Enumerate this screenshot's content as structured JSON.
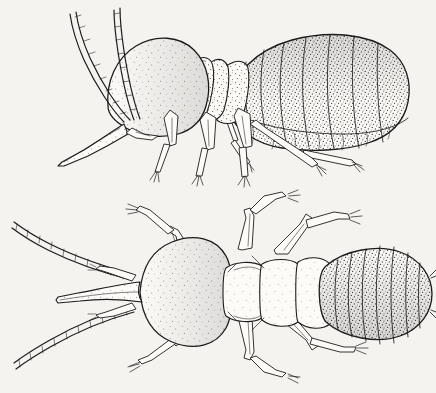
{
  "image": {
    "kind": "scientific-line-illustration",
    "technique": "pen-and-ink stipple drawing",
    "background_color": "#f4f3f0",
    "ink_color": "#1c1c1c",
    "subject_common_name": "nasute termite soldier",
    "views_count": 2,
    "visible_text": "",
    "caption": ""
  },
  "figures": [
    {
      "id": "lateral",
      "view_label": "lateral view",
      "position": "top",
      "orientation": "head to the left, abdomen to the right",
      "parts": [
        {
          "name": "head-capsule",
          "description": "large bulbous pear-shaped head, heavily stippled"
        },
        {
          "name": "nasus",
          "description": "long tapering frontal snout projecting forward and down"
        },
        {
          "name": "antenna-left",
          "description": "beaded moniliform antenna arcing up and back"
        },
        {
          "name": "antenna-right",
          "description": "second moniliform antenna arcing up and back"
        },
        {
          "name": "pronotum",
          "description": "saddle-shaped plate behind head"
        },
        {
          "name": "mesonotum",
          "description": "second thoracic plate"
        },
        {
          "name": "metanotum",
          "description": "third thoracic plate"
        },
        {
          "name": "abdomen",
          "description": "large swollen abdomen with overlapping stippled tergites"
        },
        {
          "name": "foreleg",
          "description": "slender leg with coxa, femur, tibia, tarsus and claws"
        },
        {
          "name": "midleg",
          "description": "slender leg with coxa, femur, tibia, tarsus and claws"
        },
        {
          "name": "hindleg",
          "description": "long slender leg extending back beneath abdomen"
        }
      ],
      "abdominal_tergites": 8
    },
    {
      "id": "dorsal",
      "view_label": "dorsal view",
      "position": "bottom",
      "orientation": "head to the left, abdomen to the right, symmetrical",
      "parts": [
        {
          "name": "head-capsule",
          "description": "rounded pyriform head, densely stippled"
        },
        {
          "name": "nasus",
          "description": "conical median snout pointing left"
        },
        {
          "name": "mandible-left",
          "description": "small vestigial mandible beside nasus"
        },
        {
          "name": "mandible-right",
          "description": "small vestigial mandible beside nasus"
        },
        {
          "name": "antenna-upper",
          "description": "beaded antenna sweeping up-left"
        },
        {
          "name": "antenna-lower",
          "description": "beaded antenna sweeping down-left"
        },
        {
          "name": "pronotum",
          "description": "narrow collar-like plate"
        },
        {
          "name": "mesonotum",
          "description": "second thoracic plate"
        },
        {
          "name": "metanotum",
          "description": "third thoracic plate"
        },
        {
          "name": "abdomen",
          "description": "broad oval abdomen with transverse stippled tergites"
        },
        {
          "name": "cercus-left",
          "description": "short paired appendage at abdomen tip"
        },
        {
          "name": "cercus-right",
          "description": "short paired appendage at abdomen tip"
        },
        {
          "name": "legs",
          "description": "three pairs of slender legs splayed outward"
        }
      ],
      "abdominal_tergites": 9,
      "leg_pairs": 3
    }
  ]
}
